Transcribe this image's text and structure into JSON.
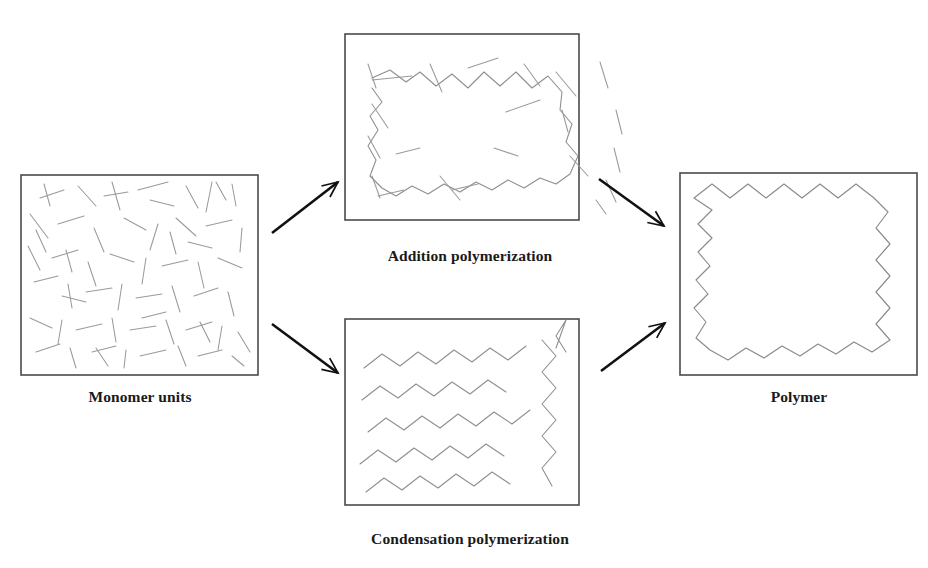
{
  "figure": {
    "title_fragment_top": "ng ly",
    "background_color": "#ffffff",
    "frame_color": "#4a4a4a",
    "monomer_color": "#9a9a9a",
    "chain_color": "#8f8f8f",
    "arrow_color": "#111111"
  },
  "panels": [
    {
      "id": "monomer-units",
      "caption": "Monomer units",
      "box": {
        "x": 21,
        "y": 175,
        "width": 237,
        "height": 200
      },
      "content": "many short disconnected line segments scattered randomly"
    },
    {
      "id": "addition-polymerization",
      "caption": "Addition polymerization",
      "box": {
        "x": 345,
        "y": 34,
        "width": 234,
        "height": 186
      },
      "content": "one long connected zigzag chain surrounded by leftover free monomer segments"
    },
    {
      "id": "condensation-polymerization",
      "caption": "Condensation polymerization",
      "box": {
        "x": 345,
        "y": 319,
        "width": 234,
        "height": 186
      },
      "content": "several medium-length zigzag oligomer chains"
    },
    {
      "id": "polymer",
      "caption": "Polymer",
      "box": {
        "x": 680,
        "y": 173,
        "width": 237,
        "height": 202
      },
      "content": "a single very long continuous zigzag polymer chain filling the box"
    }
  ],
  "arrows": [
    {
      "id": "monomer-to-addition",
      "from": [
        272,
        233
      ],
      "to": [
        338,
        182
      ],
      "direction": "up-right"
    },
    {
      "id": "monomer-to-condensation",
      "from": [
        272,
        324
      ],
      "to": [
        338,
        373
      ],
      "direction": "down-right"
    },
    {
      "id": "addition-to-polymer",
      "from": [
        599,
        179
      ],
      "to": [
        664,
        226
      ],
      "direction": "down-right"
    },
    {
      "id": "condensation-to-polymer",
      "from": [
        601,
        371
      ],
      "to": [
        665,
        323
      ],
      "direction": "up-right"
    }
  ],
  "monomer_segments": [
    [
      40,
      198,
      64,
      190
    ],
    [
      78,
      186,
      96,
      206
    ],
    [
      112,
      182,
      120,
      210
    ],
    [
      138,
      190,
      168,
      182
    ],
    [
      186,
      186,
      198,
      208
    ],
    [
      212,
      182,
      206,
      212
    ],
    [
      232,
      184,
      236,
      206
    ],
    [
      30,
      214,
      48,
      238
    ],
    [
      58,
      224,
      84,
      216
    ],
    [
      94,
      228,
      104,
      252
    ],
    [
      124,
      218,
      146,
      230
    ],
    [
      158,
      224,
      150,
      250
    ],
    [
      176,
      218,
      196,
      236
    ],
    [
      206,
      226,
      232,
      220
    ],
    [
      242,
      228,
      240,
      252
    ],
    [
      28,
      246,
      40,
      270
    ],
    [
      52,
      258,
      78,
      250
    ],
    [
      88,
      262,
      96,
      286
    ],
    [
      110,
      254,
      134,
      262
    ],
    [
      146,
      258,
      142,
      284
    ],
    [
      162,
      266,
      188,
      260
    ],
    [
      198,
      262,
      204,
      288
    ],
    [
      218,
      258,
      242,
      268
    ],
    [
      34,
      282,
      58,
      276
    ],
    [
      68,
      284,
      72,
      308
    ],
    [
      86,
      292,
      112,
      288
    ],
    [
      122,
      284,
      118,
      310
    ],
    [
      136,
      298,
      162,
      294
    ],
    [
      172,
      286,
      180,
      312
    ],
    [
      194,
      296,
      218,
      288
    ],
    [
      228,
      292,
      234,
      316
    ],
    [
      30,
      318,
      52,
      328
    ],
    [
      62,
      320,
      58,
      344
    ],
    [
      76,
      330,
      102,
      324
    ],
    [
      112,
      318,
      116,
      342
    ],
    [
      130,
      330,
      156,
      326
    ],
    [
      166,
      320,
      174,
      344
    ],
    [
      186,
      330,
      212,
      322
    ],
    [
      222,
      326,
      218,
      350
    ],
    [
      238,
      332,
      250,
      352
    ],
    [
      36,
      352,
      60,
      344
    ],
    [
      70,
      348,
      76,
      368
    ],
    [
      92,
      352,
      116,
      346
    ],
    [
      126,
      350,
      124,
      368
    ],
    [
      140,
      356,
      166,
      350
    ],
    [
      178,
      346,
      186,
      366
    ],
    [
      198,
      356,
      222,
      350
    ],
    [
      232,
      356,
      244,
      366
    ],
    [
      44,
      184,
      50,
      206
    ],
    [
      66,
      250,
      72,
      272
    ],
    [
      104,
      196,
      128,
      192
    ],
    [
      150,
      200,
      174,
      206
    ],
    [
      188,
      242,
      212,
      248
    ],
    [
      62,
      296,
      86,
      302
    ],
    [
      142,
      318,
      166,
      312
    ],
    [
      200,
      322,
      210,
      342
    ],
    [
      96,
      348,
      108,
      366
    ],
    [
      216,
      182,
      226,
      200
    ],
    [
      36,
      230,
      46,
      252
    ],
    [
      170,
      232,
      176,
      254
    ]
  ],
  "addition_free_segments": [
    [
      372,
      80,
      412,
      76
    ],
    [
      430,
      64,
      442,
      92
    ],
    [
      468,
      68,
      498,
      58
    ],
    [
      524,
      64,
      540,
      86
    ],
    [
      540,
      100,
      506,
      112
    ],
    [
      556,
      72,
      576,
      96
    ],
    [
      600,
      62,
      608,
      88
    ],
    [
      562,
      110,
      568,
      132
    ],
    [
      616,
      110,
      622,
      134
    ],
    [
      372,
      104,
      388,
      128
    ],
    [
      368,
      136,
      380,
      158
    ],
    [
      614,
      148,
      620,
      172
    ],
    [
      372,
      176,
      380,
      198
    ],
    [
      606,
      180,
      616,
      202
    ],
    [
      378,
      196,
      404,
      190
    ],
    [
      452,
      190,
      478,
      184
    ],
    [
      396,
      154,
      420,
      148
    ],
    [
      494,
      148,
      518,
      156
    ],
    [
      440,
      176,
      460,
      200
    ],
    [
      570,
      156,
      588,
      176
    ],
    [
      368,
      64,
      376,
      88
    ],
    [
      596,
      200,
      606,
      214
    ]
  ],
  "addition_chain": [
    [
      372,
      78
    ],
    [
      390,
      70
    ],
    [
      406,
      82
    ],
    [
      420,
      72
    ],
    [
      436,
      86
    ],
    [
      452,
      74
    ],
    [
      468,
      88
    ],
    [
      484,
      72
    ],
    [
      500,
      86
    ],
    [
      516,
      72
    ],
    [
      532,
      88
    ],
    [
      548,
      76
    ],
    [
      562,
      92
    ],
    [
      560,
      110
    ],
    [
      572,
      124
    ],
    [
      566,
      142
    ],
    [
      578,
      156
    ],
    [
      570,
      174
    ],
    [
      556,
      184
    ],
    [
      540,
      178
    ],
    [
      524,
      188
    ],
    [
      508,
      180
    ],
    [
      492,
      190
    ],
    [
      476,
      182
    ],
    [
      460,
      192
    ],
    [
      444,
      184
    ],
    [
      428,
      194
    ],
    [
      412,
      186
    ],
    [
      396,
      196
    ],
    [
      382,
      188
    ],
    [
      370,
      176
    ],
    [
      376,
      160
    ],
    [
      368,
      146
    ],
    [
      378,
      130
    ],
    [
      370,
      116
    ],
    [
      382,
      102
    ],
    [
      372,
      88
    ]
  ],
  "condensation_chains": [
    [
      [
        364,
        368
      ],
      [
        382,
        354
      ],
      [
        400,
        366
      ],
      [
        418,
        352
      ],
      [
        436,
        364
      ],
      [
        454,
        350
      ],
      [
        472,
        362
      ],
      [
        490,
        348
      ],
      [
        508,
        360
      ],
      [
        526,
        346
      ]
    ],
    [
      [
        362,
        400
      ],
      [
        380,
        386
      ],
      [
        398,
        398
      ],
      [
        416,
        384
      ],
      [
        434,
        396
      ],
      [
        452,
        382
      ],
      [
        470,
        394
      ],
      [
        488,
        380
      ],
      [
        506,
        392
      ]
    ],
    [
      [
        368,
        432
      ],
      [
        386,
        418
      ],
      [
        404,
        430
      ],
      [
        422,
        416
      ],
      [
        440,
        428
      ],
      [
        458,
        414
      ],
      [
        476,
        426
      ],
      [
        494,
        412
      ],
      [
        512,
        424
      ],
      [
        530,
        410
      ]
    ],
    [
      [
        360,
        464
      ],
      [
        378,
        450
      ],
      [
        396,
        462
      ],
      [
        414,
        448
      ],
      [
        432,
        460
      ],
      [
        450,
        446
      ],
      [
        468,
        458
      ],
      [
        486,
        444
      ],
      [
        504,
        456
      ]
    ],
    [
      [
        366,
        492
      ],
      [
        384,
        478
      ],
      [
        402,
        490
      ],
      [
        420,
        476
      ],
      [
        438,
        488
      ],
      [
        456,
        474
      ],
      [
        474,
        486
      ],
      [
        492,
        472
      ],
      [
        510,
        484
      ]
    ],
    [
      [
        542,
        340
      ],
      [
        556,
        356
      ],
      [
        542,
        372
      ],
      [
        556,
        388
      ],
      [
        542,
        404
      ],
      [
        556,
        420
      ],
      [
        542,
        436
      ],
      [
        556,
        452
      ],
      [
        542,
        468
      ],
      [
        552,
        486
      ]
    ],
    [
      [
        566,
        352
      ],
      [
        556,
        336
      ],
      [
        566,
        320
      ],
      [
        556,
        348
      ]
    ]
  ],
  "polymer_chain": [
    [
      694,
      198
    ],
    [
      712,
      184
    ],
    [
      730,
      198
    ],
    [
      748,
      184
    ],
    [
      766,
      198
    ],
    [
      784,
      184
    ],
    [
      802,
      198
    ],
    [
      820,
      184
    ],
    [
      838,
      198
    ],
    [
      856,
      184
    ],
    [
      874,
      198
    ],
    [
      888,
      212
    ],
    [
      876,
      228
    ],
    [
      890,
      244
    ],
    [
      876,
      260
    ],
    [
      890,
      276
    ],
    [
      876,
      292
    ],
    [
      890,
      308
    ],
    [
      876,
      324
    ],
    [
      890,
      340
    ],
    [
      872,
      352
    ],
    [
      854,
      342
    ],
    [
      836,
      354
    ],
    [
      818,
      344
    ],
    [
      800,
      356
    ],
    [
      782,
      346
    ],
    [
      764,
      358
    ],
    [
      746,
      348
    ],
    [
      728,
      360
    ],
    [
      710,
      350
    ],
    [
      696,
      338
    ],
    [
      706,
      322
    ],
    [
      694,
      308
    ],
    [
      708,
      294
    ],
    [
      696,
      280
    ],
    [
      710,
      266
    ],
    [
      698,
      252
    ],
    [
      712,
      238
    ],
    [
      698,
      224
    ],
    [
      712,
      210
    ],
    [
      694,
      198
    ]
  ]
}
